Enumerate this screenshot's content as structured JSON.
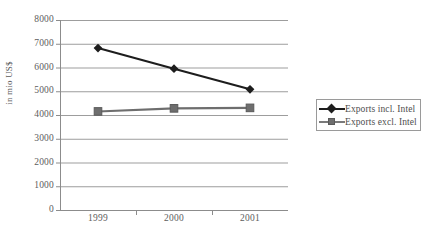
{
  "chart_data": {
    "type": "line",
    "title": "",
    "xlabel": "",
    "ylabel": "in mio US$",
    "categories": [
      "1999",
      "2000",
      "2001"
    ],
    "x": [
      1999,
      2000,
      2001
    ],
    "ylim": [
      0,
      8000
    ],
    "ytick_labels": [
      "8000",
      "7000",
      "6000",
      "5000",
      "4000",
      "3000",
      "2000",
      "1000",
      "0"
    ],
    "yticks": [
      8000,
      7000,
      6000,
      5000,
      4000,
      3000,
      2000,
      1000,
      0
    ],
    "grid": "horizontal",
    "legend_position": "right",
    "series": [
      {
        "name": "Exports incl. Intel",
        "marker": "diamond",
        "color": "#1d1d1d",
        "values": [
          6820,
          5950,
          5080
        ]
      },
      {
        "name": "Exports excl. Intel",
        "marker": "square",
        "color": "#6e6e6e",
        "values": [
          4150,
          4280,
          4300
        ]
      }
    ]
  },
  "legend": {
    "items": [
      {
        "label": "Exports incl. Intel",
        "marker": "diamond-marker-icon"
      },
      {
        "label": "Exports excl. Intel",
        "marker": "square-marker-icon"
      }
    ]
  },
  "axes": {
    "y_title": "in mio US$"
  }
}
